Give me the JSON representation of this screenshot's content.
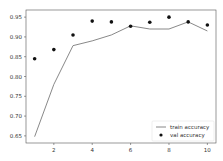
{
  "chart_data": {
    "type": "line",
    "title": "",
    "xlabel": "",
    "ylabel": "",
    "x": [
      1,
      2,
      3,
      4,
      5,
      6,
      7,
      8,
      9,
      10
    ],
    "series": [
      {
        "name": "train accuracy",
        "style": "line",
        "color": "#7a7a7a",
        "values": [
          0.648,
          0.78,
          0.878,
          0.89,
          0.905,
          0.928,
          0.92,
          0.92,
          0.938,
          0.915
        ]
      },
      {
        "name": "val accuracy",
        "style": "markers",
        "color": "#111111",
        "values": [
          0.845,
          0.868,
          0.905,
          0.94,
          0.938,
          0.927,
          0.937,
          0.95,
          0.938,
          0.93
        ]
      }
    ],
    "xticks": [
      2,
      4,
      6,
      8,
      10
    ],
    "xtick_labels": [
      "2",
      "4",
      "6",
      "8",
      "10"
    ],
    "yticks": [
      0.65,
      0.7,
      0.75,
      0.8,
      0.85,
      0.9,
      0.95
    ],
    "ytick_labels": [
      "0.65",
      "0.70",
      "0.75",
      "0.80",
      "0.85",
      "0.90",
      "0.95"
    ],
    "xlim": [
      0.55,
      10.45
    ],
    "ylim": [
      0.632,
      0.968
    ],
    "grid": false,
    "legend_position": "lower right"
  }
}
